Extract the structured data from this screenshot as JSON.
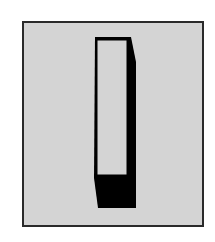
{
  "figure": {
    "colors": {
      "background": "#ffffff",
      "panel": "#d4d4d4",
      "border": "#2a2a2a",
      "switch_body": "#000000",
      "switch_face": "#d4d4d4"
    },
    "state": "off"
  }
}
